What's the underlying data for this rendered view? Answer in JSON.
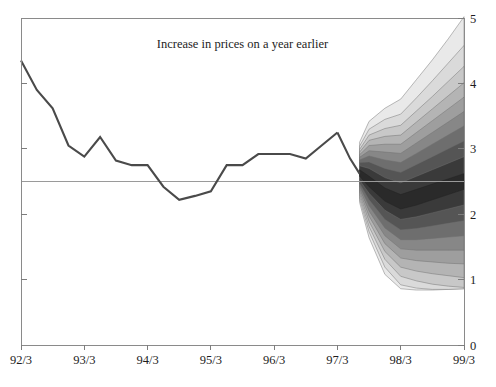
{
  "chart_data": {
    "type": "area",
    "title": "Increase in prices on a year earlier",
    "subtitle": "",
    "xlabel": "",
    "ylabel": "",
    "xlim": [
      1992.25,
      1999.25
    ],
    "ylim": [
      0,
      5
    ],
    "grid": false,
    "legend_position": "none",
    "x_tick_labels": [
      "92/3",
      "93/3",
      "94/3",
      "95/3",
      "96/3",
      "97/3",
      "98/3",
      "99/3"
    ],
    "x_tick_values": [
      1992.25,
      1993.25,
      1994.25,
      1995.25,
      1996.25,
      1997.25,
      1998.25,
      1999.25
    ],
    "y_tick_labels": [
      "0",
      "1",
      "2",
      "3",
      "4",
      "5"
    ],
    "y_tick_values": [
      0,
      1,
      2,
      3,
      4,
      5
    ],
    "y_axis_side": "right",
    "reference_line": {
      "value": 2.5,
      "label": ""
    },
    "series": [
      {
        "name": "Increase in prices on a year earlier (history)",
        "type": "line",
        "color": "#4a4a4a",
        "x": [
          1992.25,
          1992.5,
          1992.75,
          1993.0,
          1993.25,
          1993.5,
          1993.75,
          1994.0,
          1994.25,
          1994.5,
          1994.75,
          1995.0,
          1995.25,
          1995.5,
          1995.75,
          1996.0,
          1996.25,
          1996.5,
          1996.75,
          1997.0,
          1997.25
        ],
        "values": [
          4.35,
          3.9,
          3.62,
          3.05,
          2.88,
          3.18,
          2.82,
          2.75,
          2.75,
          2.42,
          2.22,
          2.28,
          2.35,
          2.75,
          2.75,
          2.92,
          2.92,
          2.92,
          2.85,
          3.05,
          3.25
        ]
      },
      {
        "name": "Increase in prices on a year earlier (history, continued)",
        "type": "line",
        "color": "#4a4a4a",
        "x": [
          1997.25,
          1997.45,
          1997.6
        ],
        "values": [
          3.25,
          2.85,
          2.62
        ]
      }
    ],
    "fan": {
      "name": "Inflation projection probability fan",
      "start_x": 1997.6,
      "end_x": 1999.25,
      "n_bands": 9,
      "darkest_color": "#2a2a2a",
      "lightest_color": "#e8e8e8",
      "central_band_label": "most likely outcome",
      "x": [
        1997.6,
        1997.75,
        1998.0,
        1998.25,
        1998.5,
        1998.75,
        1999.0,
        1999.25
      ],
      "central": {
        "upper": [
          2.68,
          2.58,
          2.4,
          2.3,
          2.38,
          2.46,
          2.54,
          2.62
        ],
        "lower": [
          2.58,
          2.42,
          2.2,
          2.08,
          2.14,
          2.22,
          2.3,
          2.38
        ]
      },
      "bands": [
        {
          "index": 1,
          "color": "#3a3a3a",
          "upper": [
            2.74,
            2.7,
            2.56,
            2.48,
            2.58,
            2.68,
            2.78,
            2.88
          ],
          "lower": [
            2.52,
            2.32,
            2.06,
            1.92,
            1.96,
            2.02,
            2.08,
            2.14
          ]
        },
        {
          "index": 2,
          "color": "#555555",
          "upper": [
            2.79,
            2.8,
            2.7,
            2.64,
            2.76,
            2.88,
            3.0,
            3.12
          ],
          "lower": [
            2.47,
            2.22,
            1.92,
            1.76,
            1.78,
            1.82,
            1.86,
            1.9
          ]
        },
        {
          "index": 3,
          "color": "#6e6e6e",
          "upper": [
            2.83,
            2.89,
            2.83,
            2.79,
            2.93,
            3.07,
            3.21,
            3.35
          ],
          "lower": [
            2.43,
            2.13,
            1.79,
            1.61,
            1.61,
            1.63,
            1.65,
            1.67
          ]
        },
        {
          "index": 4,
          "color": "#878787",
          "upper": [
            2.87,
            2.97,
            2.95,
            2.93,
            3.09,
            3.25,
            3.41,
            3.57
          ],
          "lower": [
            2.39,
            2.05,
            1.67,
            1.47,
            1.45,
            1.45,
            1.45,
            1.45
          ]
        },
        {
          "index": 5,
          "color": "#9e9e9e",
          "upper": [
            2.91,
            3.05,
            3.07,
            3.07,
            3.25,
            3.43,
            3.61,
            3.79
          ],
          "lower": [
            2.35,
            1.97,
            1.55,
            1.33,
            1.29,
            1.27,
            1.25,
            1.24
          ]
        },
        {
          "index": 6,
          "color": "#b4b4b4",
          "upper": [
            2.95,
            3.13,
            3.19,
            3.21,
            3.41,
            3.61,
            3.81,
            4.01
          ],
          "lower": [
            2.31,
            1.89,
            1.43,
            1.19,
            1.13,
            1.09,
            1.06,
            1.03
          ]
        },
        {
          "index": 7,
          "color": "#c8c8c8",
          "upper": [
            2.99,
            3.21,
            3.31,
            3.36,
            3.58,
            3.8,
            4.03,
            4.26
          ],
          "lower": [
            2.27,
            1.81,
            1.31,
            1.05,
            0.98,
            0.93,
            0.9,
            0.88
          ]
        },
        {
          "index": 8,
          "color": "#dadada",
          "upper": [
            3.04,
            3.3,
            3.45,
            3.53,
            3.78,
            4.04,
            4.31,
            4.58
          ],
          "lower": [
            2.23,
            1.73,
            1.19,
            0.92,
            0.87,
            0.85,
            0.85,
            0.86
          ]
        },
        {
          "index": 9,
          "color": "#e9e9e9",
          "upper": [
            3.1,
            3.42,
            3.62,
            3.76,
            4.06,
            4.36,
            4.68,
            5.02
          ],
          "lower": [
            2.18,
            1.64,
            1.08,
            0.86,
            0.84,
            0.84,
            0.85,
            0.86
          ]
        }
      ]
    }
  },
  "plot": {
    "title_text": "Increase in prices on a year earlier"
  }
}
